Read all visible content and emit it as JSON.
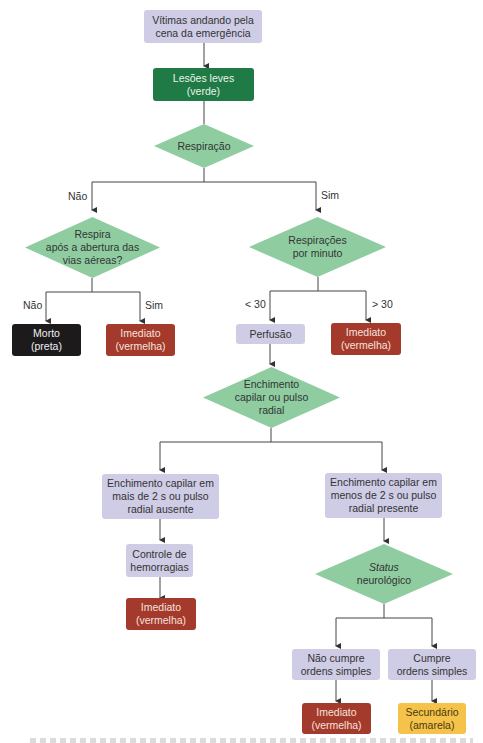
{
  "colors": {
    "lavender": "#cfcce6",
    "diamond_green": "#8fcda1",
    "green": "#1f7a45",
    "red": "#a33a2c",
    "black": "#1d1a1c",
    "yellow": "#f5c34a"
  },
  "nodes": {
    "walking": "Vítimas andando pela\ncena da emergência",
    "minor": "Lesões leves\n(verde)",
    "breathing": "Respiração",
    "airway": "Respira\napós a abertura das\nvias aéreas?",
    "rate": "Respirações\npor minuto",
    "dead": "Morto\n(preta)",
    "immediate1": "Imediato\n(vermelha)",
    "perfusion": "Perfusão",
    "immediate2": "Imediato\n(vermelha)",
    "capillary": "Enchimento\ncapilar ou pulso\nradial",
    "cap_over": "Enchimento capilar em\nmais de 2 s ou pulso\nradial ausente",
    "cap_under": "Enchimento capilar em\nmenos de 2 s ou pulso\nradial presente",
    "hemorrhage": "Controle de\nhemorragias",
    "immediate3": "Imediato\n(vermelha)",
    "neuro_italic": "Status",
    "neuro": "neurológico",
    "no_obey": "Não cumpre\nordens simples",
    "obey": "Cumpre\nordens simples",
    "immediate4": "Imediato\n(vermelha)",
    "secondary": "Secundário\n(amarela)"
  },
  "edge_labels": {
    "breathing_no": "Não",
    "breathing_yes": "Sim",
    "airway_no": "Não",
    "airway_yes": "Sim",
    "rate_lt": "< 30",
    "rate_gt": "> 30"
  }
}
